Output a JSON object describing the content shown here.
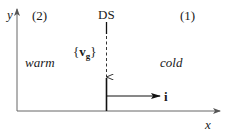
{
  "diagram": {
    "axes": {
      "x_label": "x",
      "y_label": "y"
    },
    "regions": [
      {
        "id": "2",
        "label": "(2)",
        "temperature": "warm"
      },
      {
        "id": "1",
        "label": "(1)",
        "temperature": "cold"
      }
    ],
    "interface": {
      "label": "DS"
    },
    "velocity": {
      "open_brace": "{",
      "symbol": "v",
      "subscript": "g",
      "close_brace": "}"
    },
    "normal_vector": {
      "label": "i"
    },
    "colors": {
      "line": "#1a1a1a",
      "axis": "#555555",
      "text": "#1a1a1a"
    }
  }
}
